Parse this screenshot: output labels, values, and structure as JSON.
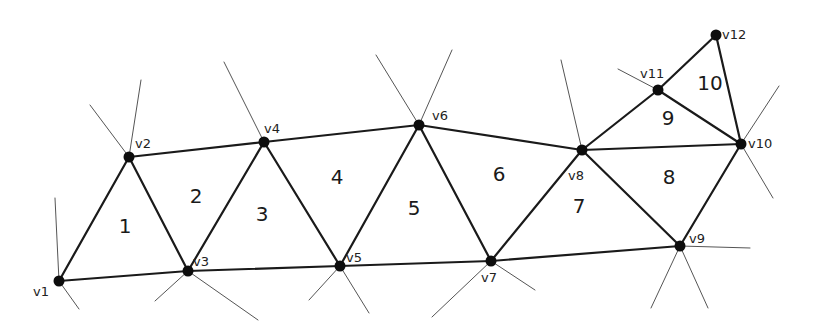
{
  "diagram": {
    "type": "triangle-strip-mesh",
    "colors": {
      "edge": "#1a1a1a",
      "stub": "#555555",
      "vertex": "#0d0d0d",
      "label": "#222222",
      "background": "#ffffff"
    },
    "vertices": [
      {
        "id": "v1",
        "label": "v1",
        "x": 59,
        "y": 281,
        "lx": 33,
        "ly": 296
      },
      {
        "id": "v2",
        "label": "v2",
        "x": 129,
        "y": 157,
        "lx": 135,
        "ly": 148
      },
      {
        "id": "v3",
        "label": "v3",
        "x": 188,
        "y": 271,
        "lx": 193,
        "ly": 266
      },
      {
        "id": "v4",
        "label": "v4",
        "x": 264,
        "y": 142,
        "lx": 264,
        "ly": 133
      },
      {
        "id": "v5",
        "label": "v5",
        "x": 340,
        "y": 266,
        "lx": 346,
        "ly": 262
      },
      {
        "id": "v6",
        "label": "v6",
        "x": 419,
        "y": 125,
        "lx": 432,
        "ly": 120
      },
      {
        "id": "v7",
        "label": "v7",
        "x": 491,
        "y": 261,
        "lx": 481,
        "ly": 282
      },
      {
        "id": "v8",
        "label": "v8",
        "x": 582,
        "y": 150,
        "lx": 568,
        "ly": 180
      },
      {
        "id": "v9",
        "label": "v9",
        "x": 680,
        "y": 246,
        "lx": 689,
        "ly": 243
      },
      {
        "id": "v10",
        "label": "v10",
        "x": 741,
        "y": 144,
        "lx": 748,
        "ly": 148
      },
      {
        "id": "v11",
        "label": "v11",
        "x": 658,
        "y": 90,
        "lx": 640,
        "ly": 78
      },
      {
        "id": "v12",
        "label": "v12",
        "x": 716,
        "y": 35,
        "lx": 722,
        "ly": 39
      }
    ],
    "edges": [
      [
        "v1",
        "v2"
      ],
      [
        "v1",
        "v3"
      ],
      [
        "v2",
        "v3"
      ],
      [
        "v2",
        "v4"
      ],
      [
        "v3",
        "v4"
      ],
      [
        "v3",
        "v5"
      ],
      [
        "v4",
        "v5"
      ],
      [
        "v4",
        "v6"
      ],
      [
        "v5",
        "v6"
      ],
      [
        "v5",
        "v7"
      ],
      [
        "v6",
        "v7"
      ],
      [
        "v6",
        "v8"
      ],
      [
        "v7",
        "v8"
      ],
      [
        "v7",
        "v9"
      ],
      [
        "v8",
        "v9"
      ],
      [
        "v8",
        "v10"
      ],
      [
        "v9",
        "v10"
      ],
      [
        "v8",
        "v11"
      ],
      [
        "v11",
        "v10"
      ],
      [
        "v11",
        "v12"
      ],
      [
        "v12",
        "v10"
      ]
    ],
    "stubs": [
      {
        "from": "v1",
        "x": 55,
        "y": 198
      },
      {
        "from": "v1",
        "x": 79,
        "y": 309
      },
      {
        "from": "v2",
        "x": 141,
        "y": 80
      },
      {
        "from": "v2",
        "x": 90,
        "y": 105
      },
      {
        "from": "v3",
        "x": 155,
        "y": 301
      },
      {
        "from": "v3",
        "x": 258,
        "y": 320
      },
      {
        "from": "v4",
        "x": 224,
        "y": 62
      },
      {
        "from": "v5",
        "x": 309,
        "y": 300
      },
      {
        "from": "v5",
        "x": 369,
        "y": 313
      },
      {
        "from": "v6",
        "x": 376,
        "y": 55
      },
      {
        "from": "v6",
        "x": 452,
        "y": 50
      },
      {
        "from": "v7",
        "x": 432,
        "y": 317
      },
      {
        "from": "v7",
        "x": 535,
        "y": 290
      },
      {
        "from": "v8",
        "x": 561,
        "y": 60
      },
      {
        "from": "v9",
        "x": 750,
        "y": 248
      },
      {
        "from": "v9",
        "x": 651,
        "y": 308
      },
      {
        "from": "v9",
        "x": 708,
        "y": 308
      },
      {
        "from": "v10",
        "x": 779,
        "y": 86
      },
      {
        "from": "v10",
        "x": 773,
        "y": 198
      },
      {
        "from": "v11",
        "x": 618,
        "y": 69
      }
    ],
    "triangles": [
      {
        "label": "1",
        "x": 125,
        "y": 227
      },
      {
        "label": "2",
        "x": 196,
        "y": 197
      },
      {
        "label": "3",
        "x": 262,
        "y": 215
      },
      {
        "label": "4",
        "x": 337,
        "y": 178
      },
      {
        "label": "5",
        "x": 414,
        "y": 209
      },
      {
        "label": "6",
        "x": 499,
        "y": 175
      },
      {
        "label": "7",
        "x": 579,
        "y": 207
      },
      {
        "label": "8",
        "x": 669,
        "y": 178
      },
      {
        "label": "9",
        "x": 668,
        "y": 119
      },
      {
        "label": "10",
        "x": 710,
        "y": 84
      }
    ]
  }
}
